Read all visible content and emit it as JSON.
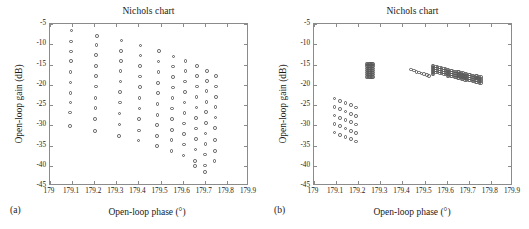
{
  "figure": {
    "panels": [
      {
        "id": "a",
        "panel_label": "(a)",
        "title": "Nichols chart",
        "xlabel": "Open-loop phase (°)",
        "ylabel": "Open-loop gain (dB)"
      },
      {
        "id": "b",
        "panel_label": "(b)",
        "title": "Nichols chart",
        "xlabel": "Open-loop phase (°)",
        "ylabel": "Open-loop gain (dB)"
      }
    ]
  },
  "chart_data": [
    {
      "type": "scatter",
      "panel": "a",
      "title": "Nichols chart",
      "xlabel": "Open-loop phase (°)",
      "ylabel": "Open-loop gain (dB)",
      "xlim": [
        179.0,
        179.9
      ],
      "ylim": [
        -45,
        -5
      ],
      "xticks": [
        179,
        179.1,
        179.2,
        179.3,
        179.4,
        179.5,
        179.6,
        179.7,
        179.8,
        179.9
      ],
      "xticklabels": [
        "179",
        "179.1",
        "179.2",
        "179.3",
        "179.4",
        "179.5",
        "179.6",
        "179.7",
        "179.8",
        "179.9"
      ],
      "yticks": [
        -5,
        -10,
        -15,
        -20,
        -25,
        -30,
        -35,
        -40,
        -45
      ],
      "yticklabels": [
        "-5",
        "-10",
        "-15",
        "-20",
        "-25",
        "-30",
        "-35",
        "-40",
        "-45"
      ],
      "grid": false,
      "legend": null,
      "marker": "open-circle",
      "marker_color": "#5a5a5a",
      "points": [
        [
          179.097,
          -6.6
        ],
        [
          179.095,
          -9.3
        ],
        [
          179.094,
          -11.8
        ],
        [
          179.094,
          -14.2
        ],
        [
          179.093,
          -16.8
        ],
        [
          179.093,
          -19.4
        ],
        [
          179.092,
          -22.0
        ],
        [
          179.092,
          -24.4
        ],
        [
          179.091,
          -26.9
        ],
        [
          179.091,
          -30.2
        ],
        [
          179.212,
          -7.9
        ],
        [
          179.21,
          -10.2
        ],
        [
          179.209,
          -12.7
        ],
        [
          179.208,
          -15.3
        ],
        [
          179.207,
          -17.8
        ],
        [
          179.207,
          -20.4
        ],
        [
          179.206,
          -23.3
        ],
        [
          179.205,
          -25.8
        ],
        [
          179.204,
          -28.4
        ],
        [
          179.203,
          -31.4
        ],
        [
          179.323,
          -9.1
        ],
        [
          179.321,
          -11.6
        ],
        [
          179.32,
          -14.1
        ],
        [
          179.319,
          -16.6
        ],
        [
          179.318,
          -19.2
        ],
        [
          179.317,
          -21.8
        ],
        [
          179.316,
          -24.4
        ],
        [
          179.315,
          -27.1
        ],
        [
          179.314,
          -29.8
        ],
        [
          179.313,
          -32.7
        ],
        [
          179.41,
          -10.3
        ],
        [
          179.409,
          -12.8
        ],
        [
          179.408,
          -15.4
        ],
        [
          179.407,
          -18.0
        ],
        [
          179.406,
          -20.6
        ],
        [
          179.405,
          -23.2
        ],
        [
          179.404,
          -25.9
        ],
        [
          179.403,
          -28.5
        ],
        [
          179.402,
          -31.3
        ],
        [
          179.401,
          -33.8
        ],
        [
          179.492,
          -11.7
        ],
        [
          179.491,
          -14.3
        ],
        [
          179.49,
          -16.9
        ],
        [
          179.489,
          -19.5
        ],
        [
          179.488,
          -22.1
        ],
        [
          179.487,
          -24.7
        ],
        [
          179.486,
          -27.4
        ],
        [
          179.485,
          -30.0
        ],
        [
          179.484,
          -32.6
        ],
        [
          179.483,
          -35.1
        ],
        [
          179.558,
          -13.0
        ],
        [
          179.557,
          -15.5
        ],
        [
          179.556,
          -18.1
        ],
        [
          179.555,
          -20.7
        ],
        [
          179.554,
          -23.3
        ],
        [
          179.553,
          -25.9
        ],
        [
          179.552,
          -28.5
        ],
        [
          179.551,
          -31.1
        ],
        [
          179.55,
          -33.7
        ],
        [
          179.549,
          -36.3
        ],
        [
          179.613,
          -14.1
        ],
        [
          179.612,
          -16.6
        ],
        [
          179.611,
          -19.2
        ],
        [
          179.61,
          -21.8
        ],
        [
          179.609,
          -24.4
        ],
        [
          179.608,
          -27.0
        ],
        [
          179.607,
          -29.6
        ],
        [
          179.606,
          -32.2
        ],
        [
          179.605,
          -34.8
        ],
        [
          179.604,
          -37.5
        ],
        [
          179.666,
          -15.3
        ],
        [
          179.665,
          -17.8
        ],
        [
          179.664,
          -20.4
        ],
        [
          179.663,
          -23.0
        ],
        [
          179.662,
          -25.6
        ],
        [
          179.661,
          -28.2
        ],
        [
          179.66,
          -30.8
        ],
        [
          179.659,
          -33.4
        ],
        [
          179.658,
          -36.0
        ],
        [
          179.657,
          -38.8
        ],
        [
          179.656,
          -40.1
        ],
        [
          179.71,
          -16.6
        ],
        [
          179.709,
          -19.1
        ],
        [
          179.708,
          -21.6
        ],
        [
          179.707,
          -24.2
        ],
        [
          179.706,
          -26.8
        ],
        [
          179.705,
          -29.4
        ],
        [
          179.704,
          -32.0
        ],
        [
          179.703,
          -34.6
        ],
        [
          179.702,
          -37.2
        ],
        [
          179.701,
          -39.9
        ],
        [
          179.7,
          -41.5
        ],
        [
          179.752,
          -17.8
        ],
        [
          179.751,
          -20.4
        ],
        [
          179.75,
          -23.0
        ],
        [
          179.749,
          -25.5
        ],
        [
          179.748,
          -28.1
        ],
        [
          179.747,
          -30.7
        ],
        [
          179.746,
          -33.6
        ],
        [
          179.745,
          -36.3
        ],
        [
          179.744,
          -38.8
        ]
      ]
    },
    {
      "type": "scatter",
      "panel": "b",
      "title": "Nichols chart",
      "xlabel": "Open-loop phase (°)",
      "ylabel": "Open-loop gain (dB)",
      "xlim": [
        179.0,
        179.9
      ],
      "ylim": [
        -45,
        -5
      ],
      "xticks": [
        179,
        179.1,
        179.2,
        179.3,
        179.4,
        179.5,
        179.6,
        179.7,
        179.8,
        179.9
      ],
      "xticklabels": [
        "179",
        "179.1",
        "179.2",
        "179.3",
        "179.4",
        "179.5",
        "179.6",
        "179.7",
        "179.8",
        "179.9"
      ],
      "yticks": [
        -5,
        -10,
        -15,
        -20,
        -25,
        -30,
        -35,
        -40,
        -45
      ],
      "yticklabels": [
        "-5",
        "-10",
        "-15",
        "-20",
        "-25",
        "-30",
        "-35",
        "-40",
        "-45"
      ],
      "grid": false,
      "legend": null,
      "marker": "open-circle",
      "marker_color": "#5a5a5a",
      "clusters": [
        {
          "name": "lower-left-sparse-grid",
          "x_start": 179.093,
          "x_step": 0.0245,
          "x_count": 5,
          "y_start": -23.4,
          "y_step": -2.1,
          "y_count": 5,
          "stagger_y": -0.55
        },
        {
          "name": "dense-block-179.25",
          "x_start": 179.238,
          "x_step": 0.0048,
          "x_count": 7,
          "y_start": -14.9,
          "y_step": -0.52,
          "y_count": 7,
          "stagger_y": 0
        }
      ],
      "points": [
        [
          179.438,
          -16.2
        ],
        [
          179.452,
          -16.5
        ],
        [
          179.463,
          -16.8
        ],
        [
          179.474,
          -17.0
        ],
        [
          179.486,
          -17.2
        ],
        [
          179.498,
          -17.4
        ],
        [
          179.51,
          -17.6
        ],
        [
          179.521,
          -17.8
        ],
        [
          179.536,
          -15.4
        ],
        [
          179.536,
          -15.9
        ],
        [
          179.536,
          -16.4
        ],
        [
          179.536,
          -16.9
        ],
        [
          179.536,
          -17.4
        ],
        [
          179.541,
          -15.4
        ],
        [
          179.541,
          -15.9
        ],
        [
          179.541,
          -16.4
        ],
        [
          179.541,
          -16.9
        ],
        [
          179.541,
          -17.4
        ],
        [
          179.553,
          -15.5
        ],
        [
          179.553,
          -16.0
        ],
        [
          179.553,
          -16.5
        ],
        [
          179.553,
          -17.0
        ],
        [
          179.558,
          -15.5
        ],
        [
          179.558,
          -16.0
        ],
        [
          179.558,
          -16.5
        ],
        [
          179.558,
          -17.0
        ],
        [
          179.571,
          -15.7
        ],
        [
          179.571,
          -16.2
        ],
        [
          179.571,
          -16.7
        ],
        [
          179.571,
          -17.2
        ],
        [
          179.576,
          -15.7
        ],
        [
          179.576,
          -16.2
        ],
        [
          179.576,
          -16.7
        ],
        [
          179.576,
          -17.2
        ],
        [
          179.589,
          -16.0
        ],
        [
          179.589,
          -16.5
        ],
        [
          179.589,
          -17.0
        ],
        [
          179.589,
          -17.5
        ],
        [
          179.594,
          -16.0
        ],
        [
          179.594,
          -16.5
        ],
        [
          179.594,
          -17.0
        ],
        [
          179.594,
          -17.5
        ],
        [
          179.604,
          -16.3
        ],
        [
          179.604,
          -16.8
        ],
        [
          179.604,
          -17.3
        ],
        [
          179.604,
          -17.8
        ],
        [
          179.609,
          -16.3
        ],
        [
          179.609,
          -16.8
        ],
        [
          179.609,
          -17.3
        ],
        [
          179.609,
          -17.8
        ],
        [
          179.62,
          -16.5
        ],
        [
          179.62,
          -17.0
        ],
        [
          179.62,
          -17.5
        ],
        [
          179.62,
          -18.0
        ],
        [
          179.625,
          -16.5
        ],
        [
          179.625,
          -17.0
        ],
        [
          179.625,
          -17.5
        ],
        [
          179.625,
          -18.0
        ],
        [
          179.636,
          -16.7
        ],
        [
          179.636,
          -17.2
        ],
        [
          179.636,
          -17.7
        ],
        [
          179.636,
          -18.2
        ],
        [
          179.641,
          -16.7
        ],
        [
          179.641,
          -17.2
        ],
        [
          179.641,
          -17.7
        ],
        [
          179.641,
          -18.2
        ],
        [
          179.652,
          -16.9
        ],
        [
          179.652,
          -17.4
        ],
        [
          179.652,
          -17.9
        ],
        [
          179.652,
          -18.4
        ],
        [
          179.657,
          -16.9
        ],
        [
          179.657,
          -17.4
        ],
        [
          179.657,
          -17.9
        ],
        [
          179.657,
          -18.4
        ],
        [
          179.668,
          -17.1
        ],
        [
          179.668,
          -17.6
        ],
        [
          179.668,
          -18.1
        ],
        [
          179.668,
          -18.6
        ],
        [
          179.673,
          -17.1
        ],
        [
          179.673,
          -17.6
        ],
        [
          179.673,
          -18.1
        ],
        [
          179.673,
          -18.6
        ],
        [
          179.684,
          -17.3
        ],
        [
          179.684,
          -17.8
        ],
        [
          179.684,
          -18.3
        ],
        [
          179.684,
          -18.8
        ],
        [
          179.689,
          -17.3
        ],
        [
          179.689,
          -17.8
        ],
        [
          179.689,
          -18.3
        ],
        [
          179.689,
          -18.8
        ],
        [
          179.7,
          -17.5
        ],
        [
          179.7,
          -18.0
        ],
        [
          179.7,
          -18.5
        ],
        [
          179.7,
          -19.0
        ],
        [
          179.705,
          -17.5
        ],
        [
          179.705,
          -18.0
        ],
        [
          179.705,
          -18.5
        ],
        [
          179.705,
          -19.0
        ],
        [
          179.716,
          -17.7
        ],
        [
          179.716,
          -18.2
        ],
        [
          179.716,
          -18.7
        ],
        [
          179.716,
          -19.2
        ],
        [
          179.721,
          -17.7
        ],
        [
          179.721,
          -18.2
        ],
        [
          179.721,
          -18.7
        ],
        [
          179.721,
          -19.2
        ],
        [
          179.733,
          -17.9
        ],
        [
          179.733,
          -18.4
        ],
        [
          179.733,
          -18.9
        ],
        [
          179.733,
          -19.4
        ],
        [
          179.738,
          -17.9
        ],
        [
          179.738,
          -18.4
        ],
        [
          179.738,
          -18.9
        ],
        [
          179.738,
          -19.4
        ],
        [
          179.749,
          -18.1
        ],
        [
          179.749,
          -18.6
        ],
        [
          179.749,
          -19.1
        ],
        [
          179.749,
          -19.6
        ],
        [
          179.754,
          -18.1
        ],
        [
          179.754,
          -18.6
        ],
        [
          179.754,
          -19.1
        ],
        [
          179.754,
          -19.6
        ]
      ]
    }
  ]
}
